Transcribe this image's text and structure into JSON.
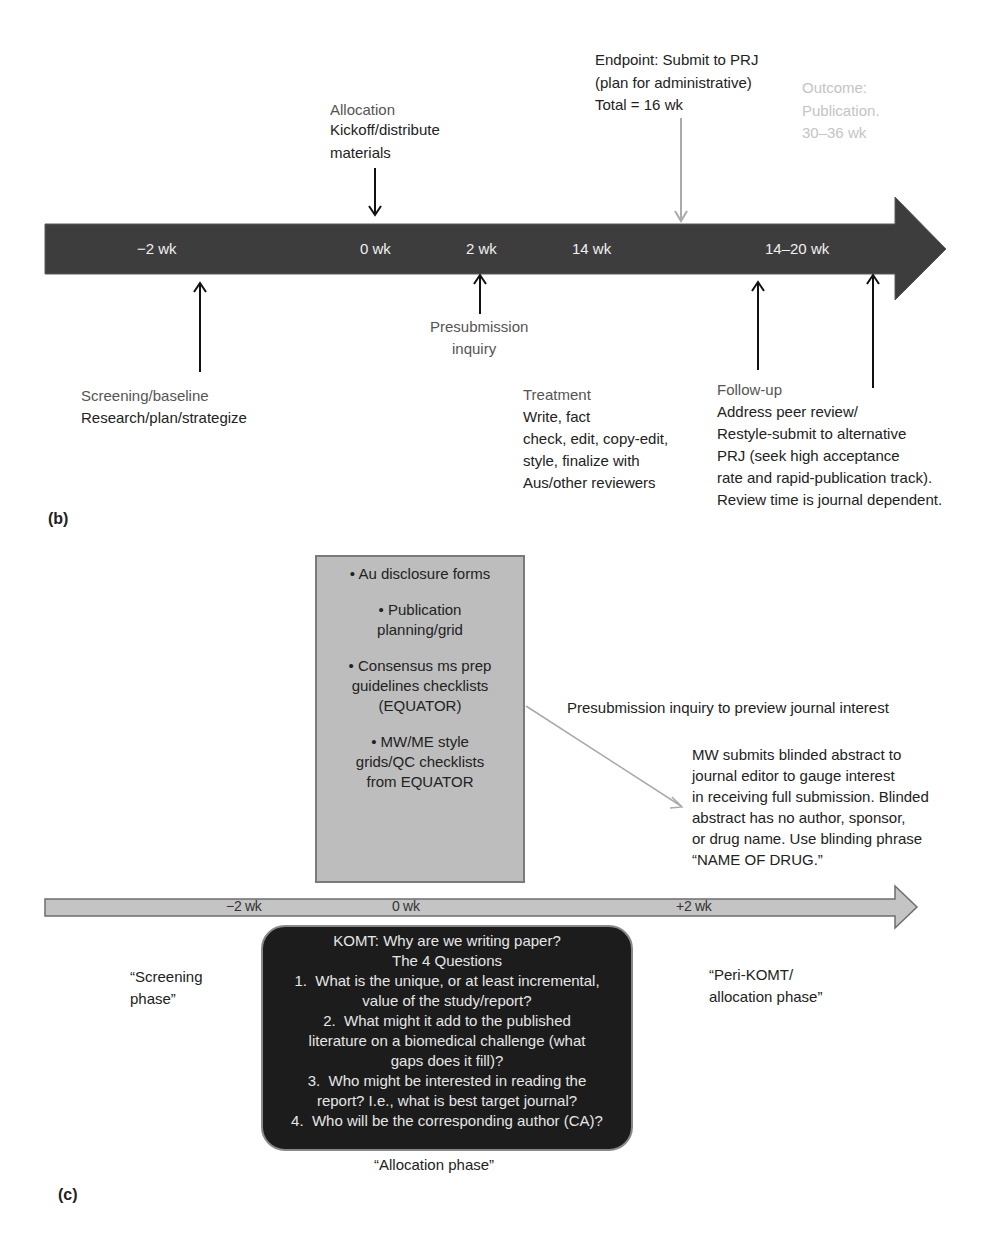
{
  "panel_b": {
    "label": "(b)",
    "timeline": {
      "bar_color": "#3d3d3d",
      "ticks": [
        "−2 wk",
        "0 wk",
        "2 wk",
        "14 wk",
        "14–20 wk"
      ]
    },
    "above": {
      "allocation": {
        "title": "Allocation",
        "lines": [
          "Kickoff/distribute",
          "materials"
        ]
      },
      "endpoint": {
        "lines": [
          "Endpoint: Submit to PRJ",
          "(plan for administrative)",
          "Total = 16 wk"
        ],
        "arrow_color": "#aaaaaa"
      },
      "outcome": {
        "lines": [
          "Outcome:",
          "Publication.",
          "30–36 wk"
        ],
        "color": "#c4c4c4"
      }
    },
    "below": {
      "screening": {
        "title": "Screening/baseline",
        "lines": [
          "Research/plan/strategize"
        ]
      },
      "presubmission": {
        "lines": [
          "Presubmission",
          "inquiry"
        ]
      },
      "treatment": {
        "title": "Treatment",
        "lines": [
          "Write, fact",
          "check, edit, copy-edit,",
          "style, finalize with",
          "Aus/other reviewers"
        ]
      },
      "followup": {
        "title": "Follow-up",
        "lines": [
          "Address peer review/",
          "Restyle-submit to alternative",
          "PRJ (seek high acceptance",
          "rate and rapid-publication track).",
          "Review time is journal dependent."
        ]
      }
    }
  },
  "panel_c": {
    "label": "(c)",
    "checklist_box": {
      "color": "#bdbdbd",
      "items": [
        "• Au disclosure forms",
        "• Publication\nplanning/grid",
        "• Consensus ms prep\nguidelines checklists\n(EQUATOR)",
        "• MW/ME style\ngrids/QC checklists\nfrom EQUATOR"
      ]
    },
    "presubmission_heading": "Presubmission inquiry to preview journal interest",
    "presubmission_detail": [
      "MW submits blinded abstract to",
      "journal editor to gauge interest",
      "in receiving full submission. Blinded",
      "abstract has no author, sponsor,",
      "or drug name. Use blinding phrase",
      "“NAME OF DRUG.”"
    ],
    "timeline": {
      "bar_color": "#c4c4c4",
      "ticks": [
        "−2 wk",
        "0 wk",
        "+2 wk"
      ]
    },
    "komt_box": {
      "color": "#1c1c1c",
      "lines": [
        "KOMT: Why are we writing paper?",
        "The 4 Questions",
        "1.  What is the unique, or at least incremental,",
        "value of the study/report?",
        "2.  What might it add to the published",
        "literature on a biomedical challenge (what",
        "gaps does it fill)?",
        "3.  Who might be interested in reading the",
        "report? I.e., what is best target journal?",
        "4.  Who will be the corresponding author (CA)?"
      ]
    },
    "phases": {
      "screening": [
        "“Screening",
        "phase”"
      ],
      "allocation": "“Allocation phase”",
      "peri_komt": [
        "“Peri-KOMT/",
        "allocation phase”"
      ]
    }
  }
}
